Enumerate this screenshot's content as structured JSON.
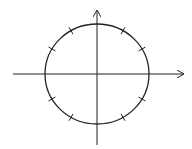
{
  "diagram": {
    "center": [
      97,
      74
    ],
    "radius": [
      52,
      50
    ],
    "ticks_degrees": [
      30,
      60,
      120,
      150,
      210,
      240,
      300,
      330
    ],
    "colors": {
      "stroke": "#222222",
      "background": "#ffffff"
    }
  }
}
